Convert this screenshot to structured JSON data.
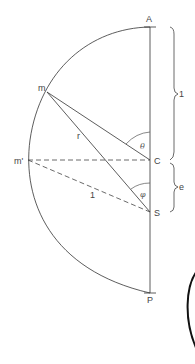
{
  "diagram": {
    "points": {
      "A": "A",
      "C": "C",
      "S": "S",
      "P": "P",
      "m": "m",
      "m_prime": "m'"
    },
    "segment_labels": {
      "r": "r",
      "one": "1"
    },
    "angles": {
      "theta": "θ",
      "phi": "φ"
    },
    "braces": {
      "upper": "1",
      "lower": "e"
    },
    "colors": {
      "line": "#333333",
      "dashed": "#444444",
      "circle": "#111111"
    }
  }
}
